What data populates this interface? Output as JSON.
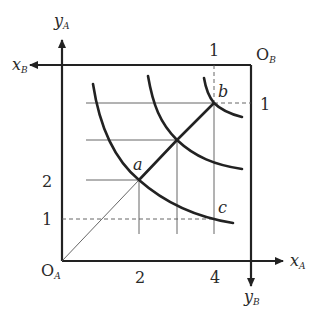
{
  "diagram": {
    "type": "edgeworth-box",
    "colors": {
      "ink": "#222222",
      "thin": "#555555",
      "background": "#ffffff"
    },
    "origins": {
      "a": {
        "main": "O",
        "sub": "A"
      },
      "b": {
        "main": "O",
        "sub": "B"
      }
    },
    "axes": {
      "x_a": {
        "main": "x",
        "sub": "A"
      },
      "y_a": {
        "main": "y",
        "sub": "A"
      },
      "x_b": {
        "main": "x",
        "sub": "B"
      },
      "y_b": {
        "main": "y",
        "sub": "B"
      }
    },
    "ticks": {
      "y_a": [
        "2",
        "1"
      ],
      "x_a": [
        "2",
        "4"
      ],
      "x_b": [
        "1"
      ],
      "y_b": [
        "1"
      ]
    },
    "points": {
      "a": "a",
      "b": "b",
      "c": "c"
    }
  }
}
